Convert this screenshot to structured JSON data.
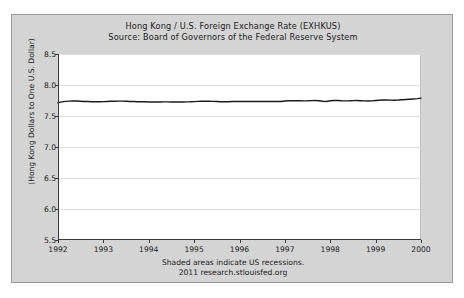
{
  "chart_data": {
    "type": "line",
    "title": "Hong Kong / U.S. Foreign Exchange Rate (EXHKUS)",
    "subtitle": "Source: Board of Governors of the Federal Reserve System",
    "xlabel": "",
    "ylabel": "(Hong Kong Dollars to One U.S. Dollar)",
    "xlim": [
      1992,
      2000
    ],
    "ylim": [
      5.5,
      8.5
    ],
    "yticks": [
      5.5,
      6.0,
      6.5,
      7.0,
      7.5,
      8.0,
      8.5
    ],
    "ytick_labels": [
      "5.5",
      "6.0",
      "6.5",
      "7.0",
      "7.5",
      "8.0",
      "8.5"
    ],
    "xticks": [
      1992,
      1993,
      1994,
      1995,
      1996,
      1997,
      1998,
      1999,
      2000
    ],
    "xtick_labels": [
      "1992",
      "1993",
      "1994",
      "1995",
      "1996",
      "1997",
      "1998",
      "1999",
      "2000"
    ],
    "grid": "horizontal",
    "legend": "none",
    "line_color": "#1a1a1a",
    "plot_background": "#ffffff",
    "panel_background": "#d4d4d4",
    "recession_note": "Shaded areas indicate US recessions.",
    "series": [
      {
        "name": "EXHKUS",
        "x": [
          1992.0,
          1992.083,
          1992.167,
          1992.25,
          1992.333,
          1992.417,
          1992.5,
          1992.583,
          1992.667,
          1992.75,
          1992.833,
          1992.917,
          1993.0,
          1993.083,
          1993.167,
          1993.25,
          1993.333,
          1993.417,
          1993.5,
          1993.583,
          1993.667,
          1993.75,
          1993.833,
          1993.917,
          1994.0,
          1994.083,
          1994.167,
          1994.25,
          1994.333,
          1994.417,
          1994.5,
          1994.583,
          1994.667,
          1994.75,
          1994.833,
          1994.917,
          1995.0,
          1995.083,
          1995.167,
          1995.25,
          1995.333,
          1995.417,
          1995.5,
          1995.583,
          1995.667,
          1995.75,
          1995.833,
          1995.917,
          1996.0,
          1996.083,
          1996.167,
          1996.25,
          1996.333,
          1996.417,
          1996.5,
          1996.583,
          1996.667,
          1996.75,
          1996.833,
          1996.917,
          1997.0,
          1997.083,
          1997.167,
          1997.25,
          1997.333,
          1997.417,
          1997.5,
          1997.583,
          1997.667,
          1997.75,
          1997.833,
          1997.917,
          1998.0,
          1998.083,
          1998.167,
          1998.25,
          1998.333,
          1998.417,
          1998.5,
          1998.583,
          1998.667,
          1998.75,
          1998.833,
          1998.917,
          1999.0,
          1999.083,
          1999.167,
          1999.25,
          1999.333,
          1999.417,
          1999.5,
          1999.583,
          1999.667,
          1999.75,
          1999.833,
          1999.917,
          2000.0
        ],
        "values": [
          7.713,
          7.727,
          7.736,
          7.74,
          7.742,
          7.741,
          7.738,
          7.735,
          7.733,
          7.731,
          7.73,
          7.729,
          7.732,
          7.735,
          7.737,
          7.739,
          7.74,
          7.74,
          7.738,
          7.735,
          7.733,
          7.731,
          7.73,
          7.729,
          7.727,
          7.726,
          7.726,
          7.727,
          7.728,
          7.728,
          7.727,
          7.726,
          7.726,
          7.727,
          7.728,
          7.729,
          7.732,
          7.736,
          7.738,
          7.739,
          7.738,
          7.736,
          7.733,
          7.731,
          7.73,
          7.731,
          7.733,
          7.734,
          7.735,
          7.735,
          7.734,
          7.733,
          7.733,
          7.733,
          7.734,
          7.735,
          7.735,
          7.734,
          7.733,
          7.733,
          7.742,
          7.746,
          7.748,
          7.747,
          7.745,
          7.744,
          7.745,
          7.748,
          7.75,
          7.745,
          7.738,
          7.734,
          7.746,
          7.751,
          7.75,
          7.746,
          7.744,
          7.745,
          7.748,
          7.749,
          7.747,
          7.744,
          7.742,
          7.744,
          7.751,
          7.755,
          7.757,
          7.757,
          7.756,
          7.755,
          7.757,
          7.761,
          7.765,
          7.769,
          7.774,
          7.78,
          7.788
        ]
      }
    ]
  },
  "footer": {
    "line1": "Shaded areas indicate US recessions.",
    "line2": "2011 research.stlouisfed.org"
  }
}
